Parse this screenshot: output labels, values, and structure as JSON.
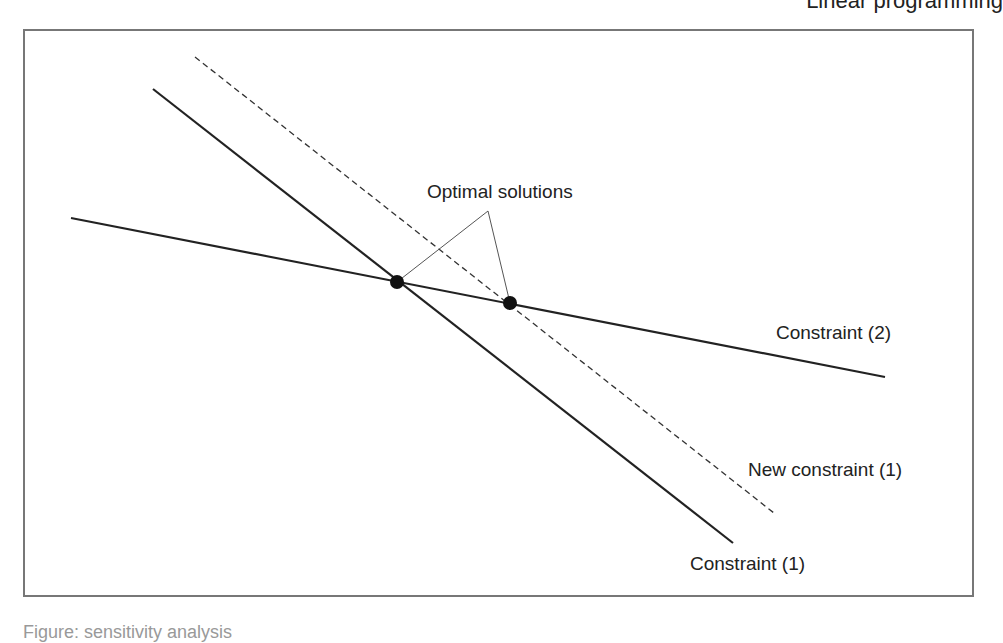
{
  "header": {
    "text": "Linear programming"
  },
  "diagram": {
    "labels": {
      "optimal": "Optimal solutions",
      "constraint2": "Constraint (2)",
      "new_constraint1": "New constraint (1)",
      "constraint1": "Constraint (1)"
    },
    "colors": {
      "line": "#222222",
      "frame": "#777777",
      "pointer": "#555555"
    },
    "points": [
      {
        "name": "optimal-1",
        "x": 397,
        "y": 282
      },
      {
        "name": "optimal-2",
        "x": 510,
        "y": 303
      }
    ]
  },
  "caption": {
    "text": "Figure: sensitivity analysis"
  }
}
